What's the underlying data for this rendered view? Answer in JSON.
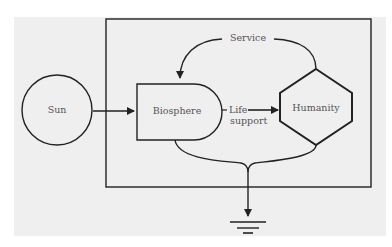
{
  "diagram": {
    "nodes": {
      "sun": {
        "label": "Sun",
        "shape": "circle"
      },
      "biosphere": {
        "label": "Biosphere",
        "shape": "rounded-d"
      },
      "humanity": {
        "label": "Humanity",
        "shape": "hexagon"
      }
    },
    "edges": {
      "service": {
        "label": "Service",
        "from": "humanity",
        "to": "biosphere"
      },
      "life_support": {
        "label_line1": "Life",
        "label_line2": "support",
        "from": "biosphere",
        "to": "humanity"
      },
      "energy_in": {
        "from": "sun",
        "to": "biosphere"
      },
      "heat_sink": {
        "from": "biosphere+humanity",
        "to": "ground"
      }
    },
    "colors": {
      "stroke": "#222222",
      "background": "#efefef",
      "text": "#555555"
    }
  }
}
